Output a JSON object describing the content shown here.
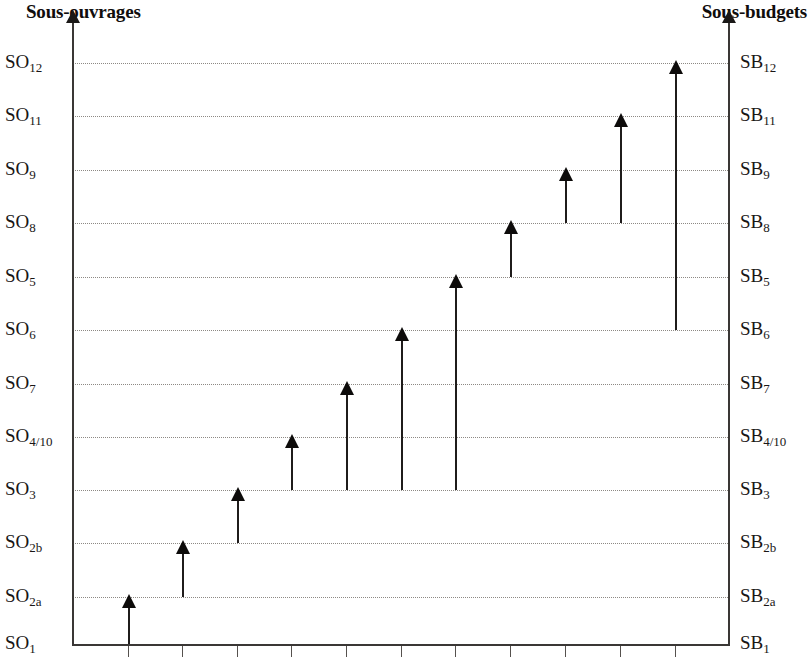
{
  "left_axis": {
    "title": "Sous-ouvrages",
    "prefix": "SO",
    "labels": [
      {
        "base": "SO",
        "sub": "12"
      },
      {
        "base": "SO",
        "sub": "11"
      },
      {
        "base": "SO",
        "sub": "9"
      },
      {
        "base": "SO",
        "sub": "8"
      },
      {
        "base": "SO",
        "sub": "5"
      },
      {
        "base": "SO",
        "sub": "6"
      },
      {
        "base": "SO",
        "sub": "7"
      },
      {
        "base": "SO",
        "sub": "4/10"
      },
      {
        "base": "SO",
        "sub": "3"
      },
      {
        "base": "SO",
        "sub": "2b"
      },
      {
        "base": "SO",
        "sub": "2a"
      },
      {
        "base": "SO",
        "sub": "1"
      }
    ]
  },
  "right_axis": {
    "title": "Sous-budgets",
    "prefix": "SB",
    "labels": [
      {
        "base": "SB",
        "sub": "12"
      },
      {
        "base": "SB",
        "sub": "11"
      },
      {
        "base": "SB",
        "sub": "9"
      },
      {
        "base": "SB",
        "sub": "8"
      },
      {
        "base": "SB",
        "sub": "5"
      },
      {
        "base": "SB",
        "sub": "6"
      },
      {
        "base": "SB",
        "sub": "7"
      },
      {
        "base": "SB",
        "sub": "4/10"
      },
      {
        "base": "SB",
        "sub": "3"
      },
      {
        "base": "SB",
        "sub": "2b"
      },
      {
        "base": "SB",
        "sub": "2a"
      },
      {
        "base": "SB",
        "sub": "1"
      }
    ]
  },
  "colors": {
    "axis": "#3a3735",
    "arrow": "#0d0b0a",
    "gridline": "#8d8984",
    "text": "#191615",
    "background": "#ffffff"
  },
  "chart_data": {
    "type": "bar",
    "title": "",
    "xlabel": "",
    "ylabel": "Sous-ouvrages",
    "y2label": "Sous-budgets",
    "grid": true,
    "legend": "none",
    "orientation": "vertical-arrows",
    "y_categories_top_to_bottom": [
      "SO12",
      "SO11",
      "SO9",
      "SO8",
      "SO5",
      "SO6",
      "SO7",
      "SO4/10",
      "SO3",
      "SO2b",
      "SO2a",
      "SO1"
    ],
    "y2_categories_top_to_bottom": [
      "SB12",
      "SB11",
      "SB9",
      "SB8",
      "SB5",
      "SB6",
      "SB7",
      "SB4/10",
      "SB3",
      "SB2b",
      "SB2a",
      "SB1"
    ],
    "y_levels_bottom_to_top": [
      "SO1",
      "SO2a",
      "SO2b",
      "SO3",
      "SO4/10",
      "SO7",
      "SO6",
      "SO5",
      "SO8",
      "SO9",
      "SO11",
      "SO12"
    ],
    "x_tick_count": 11,
    "series": [
      {
        "name": "Arrows (start level -> end level)",
        "values": [
          {
            "index": 1,
            "start": "SO1",
            "end": "SO2a",
            "start_level": 0,
            "end_level": 1
          },
          {
            "index": 2,
            "start": "SO2a",
            "end": "SO2b",
            "start_level": 1,
            "end_level": 2
          },
          {
            "index": 3,
            "start": "SO2b",
            "end": "SO3",
            "start_level": 2,
            "end_level": 3
          },
          {
            "index": 4,
            "start": "SO3",
            "end": "SO4/10",
            "start_level": 3,
            "end_level": 4
          },
          {
            "index": 5,
            "start": "SO3",
            "end": "SO7",
            "start_level": 3,
            "end_level": 5
          },
          {
            "index": 6,
            "start": "SO3",
            "end": "SO6",
            "start_level": 3,
            "end_level": 6
          },
          {
            "index": 7,
            "start": "SO3",
            "end": "SO5",
            "start_level": 3,
            "end_level": 7
          },
          {
            "index": 8,
            "start": "SO5",
            "end": "SO8",
            "start_level": 7,
            "end_level": 8
          },
          {
            "index": 9,
            "start": "SO8",
            "end": "SO9",
            "start_level": 8,
            "end_level": 9
          },
          {
            "index": 10,
            "start": "SO8",
            "end": "SO11",
            "start_level": 8,
            "end_level": 10
          },
          {
            "index": 11,
            "start": "SO6",
            "end": "SO12",
            "start_level": 6,
            "end_level": 11
          }
        ]
      }
    ]
  },
  "geometry": {
    "gridline_y": [
      63,
      116,
      170,
      223,
      277,
      330,
      384,
      437,
      490,
      543,
      597,
      644
    ],
    "tick_x": [
      128,
      182,
      237,
      291,
      346,
      401,
      455,
      510,
      565,
      620,
      675
    ],
    "left_axis_x": 72,
    "right_axis_x": 728,
    "baseline_y": 644,
    "axis_top_y": 22
  }
}
